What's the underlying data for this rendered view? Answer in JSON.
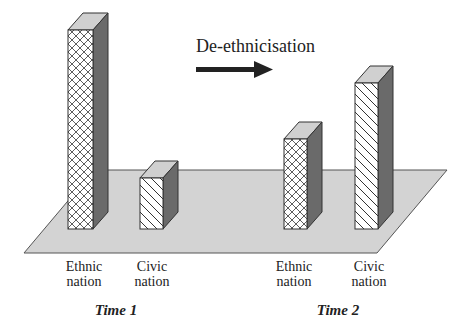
{
  "title": "De-ethnicisation",
  "arrow": "right-arrow",
  "colors": {
    "platform": "#d3d3d3",
    "side": "#6a6a6a",
    "top": "#d0d0d0",
    "front": "#ffffff",
    "stroke": "#333333"
  },
  "groups": [
    {
      "label": "Time 1",
      "bars": [
        {
          "label_line1": "Ethnic",
          "label_line2": "nation",
          "pattern": "crosshatch",
          "relative_height": 199
        },
        {
          "label_line1": "Civic",
          "label_line2": "nation",
          "pattern": "diagonal",
          "relative_height": 51
        }
      ]
    },
    {
      "label": "Time 2",
      "bars": [
        {
          "label_line1": "Ethnic",
          "label_line2": "nation",
          "pattern": "crosshatch",
          "relative_height": 90
        },
        {
          "label_line1": "Civic",
          "label_line2": "nation",
          "pattern": "diagonal",
          "relative_height": 146
        }
      ]
    }
  ]
}
